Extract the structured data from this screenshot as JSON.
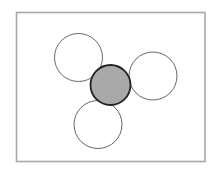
{
  "diagram": {
    "frame": {
      "x": 16.5,
      "y": 12.5,
      "width": 188.5,
      "height": 149,
      "stroke": "#a8a8a8"
    },
    "circles": [
      {
        "id": "top-left",
        "cx": 78.5,
        "cy": 57.5,
        "r": 24,
        "fill": "#ffffff",
        "stroke": "#555555",
        "stroke_width": 0.9
      },
      {
        "id": "right",
        "cx": 153,
        "cy": 76,
        "r": 24,
        "fill": "#ffffff",
        "stroke": "#555555",
        "stroke_width": 0.9
      },
      {
        "id": "bottom",
        "cx": 98,
        "cy": 124.5,
        "r": 24,
        "fill": "#ffffff",
        "stroke": "#555555",
        "stroke_width": 0.9
      },
      {
        "id": "center",
        "cx": 110.5,
        "cy": 85,
        "r": 20,
        "fill": "#a9a9a9",
        "stroke": "#222222",
        "stroke_width": 1.8
      }
    ]
  }
}
